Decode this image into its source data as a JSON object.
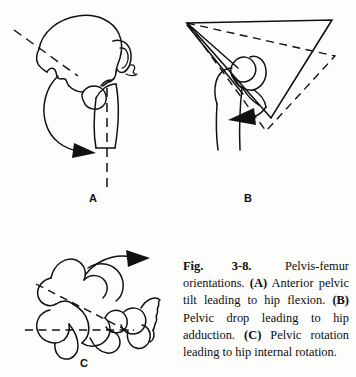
{
  "figure": {
    "number": "Fig. 3-8.",
    "caption_lead": "Pelvis-femur orientations.",
    "caption_full": "Fig. 3-8. Pelvis-femur orientations. (A) Anterior pelvic tilt leading to hip flexion. (B) Pelvic drop leading to hip adduction. (C) Pelvic rotation leading to hip internal rotation.",
    "caption_parts": {
      "p0_text": " Pelvis-femur orientations. ",
      "p1_tag": "(A)",
      "p1_text": " Anterior pelvic tilt leading to hip flexion. ",
      "p2_tag": "(B)",
      "p2_text": " Pelvic drop leading to hip adduction. ",
      "p3_tag": "(C)",
      "p3_text": " Pelvic rotation leading to hip internal rotation."
    }
  },
  "panels": [
    {
      "id": "A",
      "label": "A",
      "title": "Anterior pelvic tilt leading to hip flexion",
      "elements": {
        "bone": "pelvis-and-femur-lateral-view",
        "reference_line": "dashed-oblique-axis",
        "vertical_line": "dashed-vertical-femur-axis",
        "motion_arrow": "curved-arrow-anterior-tilt"
      }
    },
    {
      "id": "B",
      "label": "B",
      "title": "Pelvic drop leading to hip adduction",
      "elements": {
        "bone": "pelvis-and-femur-frontal-view",
        "reference_shape": "solid-triangle-level-pelvis",
        "displaced_shape": "dashed-triangle-dropped-pelvis",
        "motion_arrow": "arrow-hip-adduction"
      }
    },
    {
      "id": "C",
      "label": "C",
      "title": "Pelvic rotation leading to hip internal rotation",
      "elements": {
        "bone": "pelvis-and-femur-superior-view",
        "reference_line": "dashed-horizontal-axis",
        "rotated_line": "dashed-oblique-rotated-axis",
        "motion_arrow": "curved-arrow-pelvic-rotation"
      }
    }
  ],
  "colors": {
    "ink": "#111111",
    "page": "#fdfdfc",
    "caption_text": "#0d0d0d"
  }
}
